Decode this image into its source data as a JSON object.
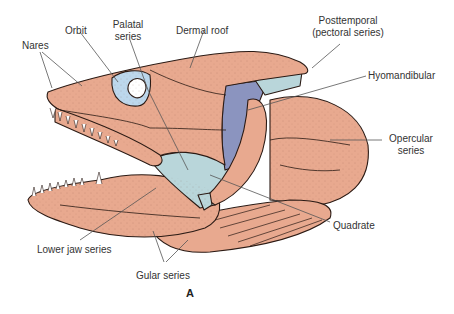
{
  "figure": {
    "panel_label": "A",
    "colors": {
      "bone": "#e8a98f",
      "outline": "#2a1a14",
      "hyomandibular": "#8b94bf",
      "palatal": "#b9d6da",
      "orbit_fill": "#bcd7ec",
      "leader_line": "#555555",
      "background": "#ffffff"
    },
    "labels": {
      "nares": "Nares",
      "orbit": "Orbit",
      "palatal_1": "Palatal",
      "palatal_2": "series",
      "dermal_roof": "Dermal roof",
      "posttemporal_1": "Posttemporal",
      "posttemporal_2": "(pectoral series)",
      "hyomandibular": "Hyomandibular",
      "opercular_1": "Opercular",
      "opercular_2": "series",
      "quadrate": "Quadrate",
      "lower_jaw": "Lower jaw series",
      "gular": "Gular series"
    }
  }
}
